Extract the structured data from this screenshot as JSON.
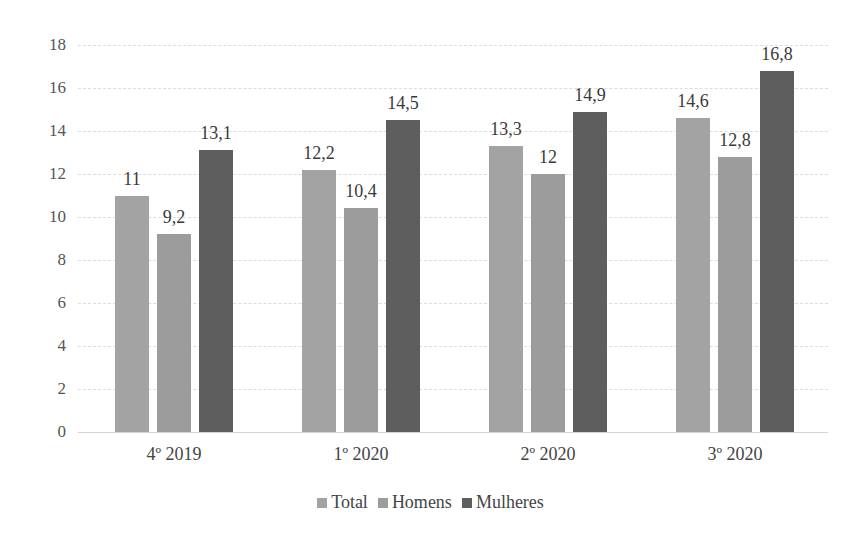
{
  "chart_data": {
    "type": "bar",
    "title": "",
    "xlabel": "",
    "ylabel": "",
    "ylim": [
      0,
      18
    ],
    "yticks": [
      0,
      2,
      4,
      6,
      8,
      10,
      12,
      14,
      16,
      18
    ],
    "grid": true,
    "legend_position": "bottom",
    "categories": [
      "4º 2019",
      "1º 2020",
      "2º 2020",
      "3º 2020"
    ],
    "series": [
      {
        "name": "Total",
        "color": "#a3a3a3",
        "values": [
          11,
          12.2,
          13.3,
          14.6
        ],
        "labels": [
          "11",
          "12,2",
          "13,3",
          "14,6"
        ]
      },
      {
        "name": "Homens",
        "color": "#9c9c9c",
        "values": [
          9.2,
          10.4,
          12,
          12.8
        ],
        "labels": [
          "9,2",
          "10,4",
          "12",
          "12,8"
        ]
      },
      {
        "name": "Mulheres",
        "color": "#5e5e5e",
        "values": [
          13.1,
          14.5,
          14.9,
          16.8
        ],
        "labels": [
          "13,1",
          "14,5",
          "14,9",
          "16,8"
        ]
      }
    ]
  }
}
